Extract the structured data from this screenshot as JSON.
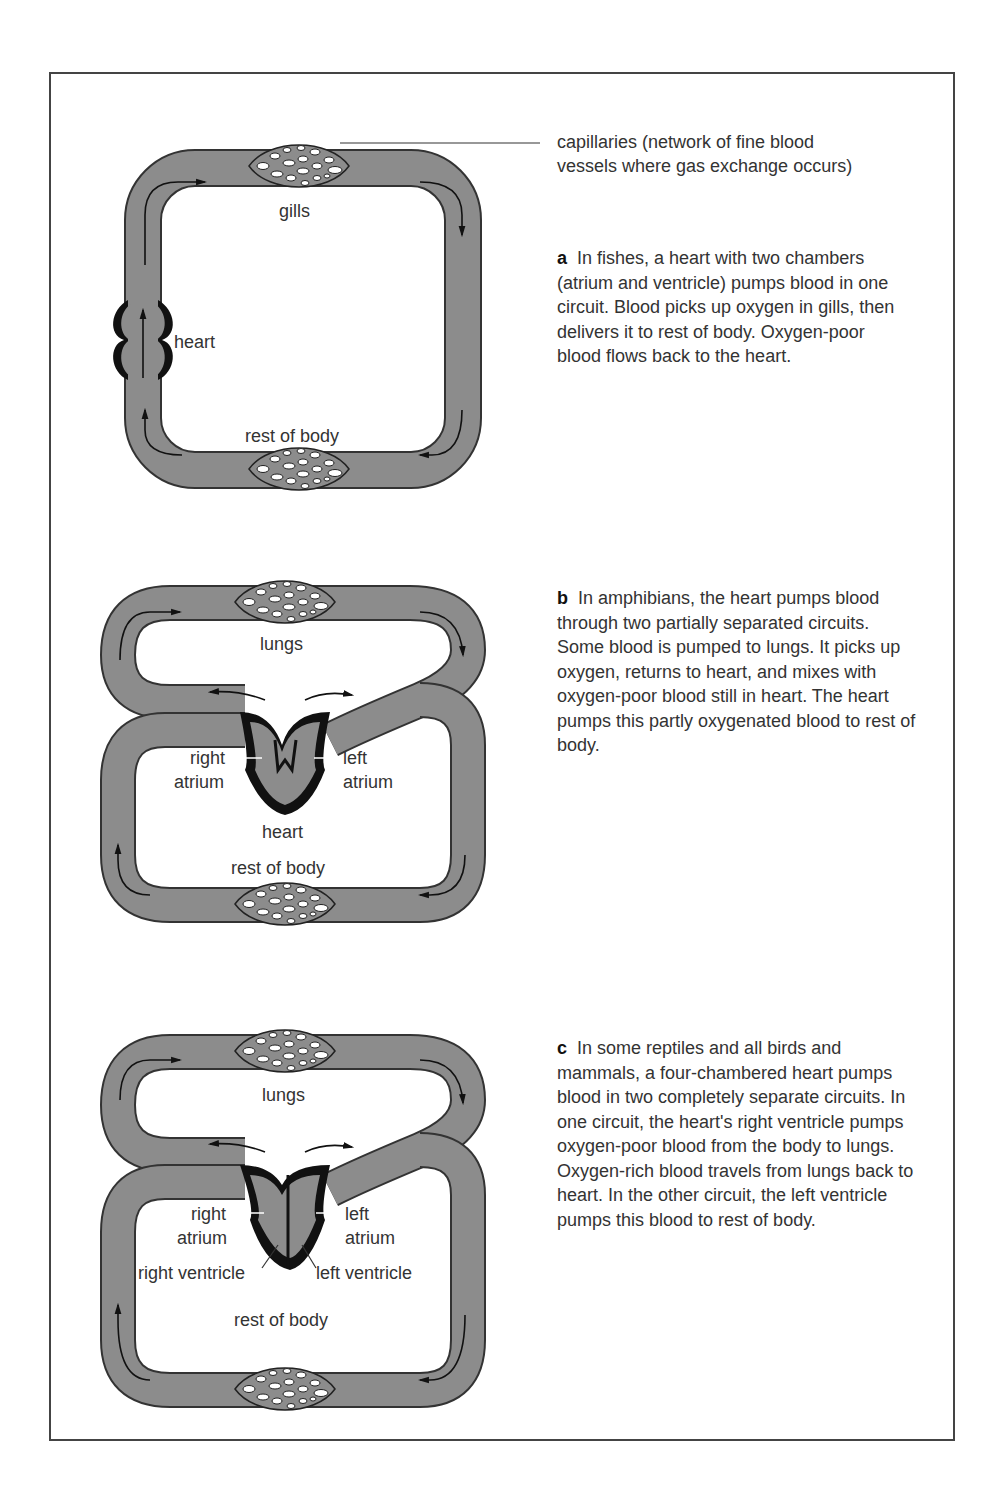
{
  "figure": {
    "callout": "capillaries (network of fine blood vessels where gas exchange occurs)",
    "callout_line1": "capillaries (network of fine blood",
    "callout_line2": "vessels where gas exchange occurs)",
    "panels": [
      {
        "id": "a",
        "letter": "a",
        "caption": "In fishes, a heart with two chambers (atrium and ventricle) pumps blood in one circuit. Blood picks up oxygen in gills, then delivers it to rest of body. Oxygen-poor blood flows back to the heart.",
        "labels": {
          "top_organ": "gills",
          "heart": "heart",
          "body": "rest of body"
        }
      },
      {
        "id": "b",
        "letter": "b",
        "caption": "In amphibians, the heart pumps blood through two partially separated circuits. Some blood is pumped to lungs. It picks up oxygen, returns to heart, and mixes with oxygen-poor blood still in heart. The heart pumps this partly oxygenated blood to rest of body.",
        "labels": {
          "top_organ": "lungs",
          "right_atrium_1": "right",
          "right_atrium_2": "atrium",
          "left_atrium_1": "left",
          "left_atrium_2": "atrium",
          "heart": "heart",
          "body": "rest of body"
        }
      },
      {
        "id": "c",
        "letter": "c",
        "caption": "In some reptiles and all birds and mammals, a four-chambered heart pumps blood in two completely separate circuits. In one circuit, the heart's right ventricle pumps oxygen-poor blood from the body to lungs. Oxygen-rich blood travels from lungs back to heart. In the other circuit, the left ventricle pumps this blood to rest of body.",
        "labels": {
          "top_organ": "lungs",
          "right_atrium_1": "right",
          "right_atrium_2": "atrium",
          "left_atrium_1": "left",
          "left_atrium_2": "atrium",
          "right_ventricle": "right ventricle",
          "left_ventricle": "left ventricle",
          "body": "rest of body"
        }
      }
    ]
  },
  "colors": {
    "vessel": "#8c8c8c",
    "outline": "#333333",
    "heart": "#111111",
    "frame": "#444444"
  }
}
